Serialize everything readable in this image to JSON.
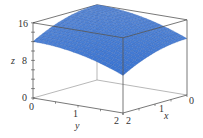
{
  "chart_data": {
    "type": "surface",
    "title": "",
    "function": "z = 16 - x^2 - y^2",
    "xlabel": "x",
    "ylabel": "y",
    "zlabel": "z",
    "x_range": [
      0,
      2
    ],
    "y_range": [
      0,
      2
    ],
    "z_range": [
      0,
      16
    ],
    "x_ticks": [
      "0",
      "1",
      "2"
    ],
    "y_ticks": [
      "0",
      "1",
      "2"
    ],
    "z_ticks": [
      "0",
      "8",
      "16"
    ],
    "grid_resolution": 20,
    "surface_color": "#4a7fd6",
    "mesh_color": "#2b58a8",
    "box": true
  }
}
